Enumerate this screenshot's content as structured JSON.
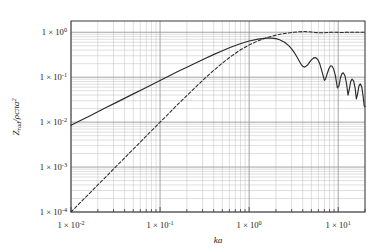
{
  "figure": {
    "background_color": "#ffffff",
    "frame_color": "#3a3a3a",
    "major_grid_color": "#9a9a9a",
    "minor_grid_color": "#c4c4c4",
    "curve_color": "#2b2b2b"
  },
  "axes": {
    "x": {
      "label": "ka",
      "scale": "log",
      "range": [
        0.01,
        20.0
      ],
      "tick_labels": [
        "1 × 10",
        "1 × 10",
        "1 × 10",
        "1 × 10"
      ],
      "tick_mantissa": "1 × 10",
      "tick_exponents": [
        "-2",
        "-1",
        "0",
        "1"
      ],
      "tick_values": [
        0.01,
        0.1,
        1,
        10
      ]
    },
    "y": {
      "label_parts": {
        "symbol": "Z",
        "subscript": "rad",
        "divider": "/",
        "denominator": "ρcπa",
        "denominator_exponent": "2"
      },
      "label_plain": "Zrad/ρcπa2",
      "scale": "log",
      "range": [
        0.0001,
        1.78
      ],
      "tick_mantissa": "1 × 10",
      "tick_exponents": [
        "0",
        "-1",
        "-2",
        "-3",
        "-4"
      ],
      "tick_values": [
        1,
        0.1,
        0.01,
        0.001,
        0.0001
      ]
    }
  },
  "chart_data": {
    "type": "line",
    "title": "",
    "xlabel": "ka",
    "ylabel": "Zrad/ρcπa2",
    "xscale": "log",
    "yscale": "log",
    "xlim": [
      0.01,
      20.0
    ],
    "ylim": [
      0.0001,
      1.78
    ],
    "grid": true,
    "minor_grid": true,
    "legend": null,
    "series": [
      {
        "name": "reactance",
        "style": "solid",
        "points": [
          [
            0.01,
            0.00849
          ],
          [
            0.0126,
            0.01069
          ],
          [
            0.0158,
            0.01342
          ],
          [
            0.02,
            0.01698
          ],
          [
            0.0251,
            0.02131
          ],
          [
            0.0316,
            0.02683
          ],
          [
            0.0398,
            0.03378
          ],
          [
            0.0501,
            0.04252
          ],
          [
            0.0631,
            0.05352
          ],
          [
            0.0794,
            0.06732
          ],
          [
            0.1,
            0.08465
          ],
          [
            0.126,
            0.1063
          ],
          [
            0.158,
            0.1332
          ],
          [
            0.2,
            0.1666
          ],
          [
            0.251,
            0.2077
          ],
          [
            0.316,
            0.2578
          ],
          [
            0.398,
            0.3179
          ],
          [
            0.501,
            0.3886
          ],
          [
            0.631,
            0.4687
          ],
          [
            0.794,
            0.5541
          ],
          [
            1.0,
            0.637
          ],
          [
            1.26,
            0.7052
          ],
          [
            1.58,
            0.7425
          ],
          [
            1.8,
            0.742
          ],
          [
            2.0,
            0.7208
          ],
          [
            2.2,
            0.6818
          ],
          [
            2.5,
            0.5979
          ],
          [
            2.8,
            0.4968
          ],
          [
            3.0,
            0.4266
          ],
          [
            3.2,
            0.3577
          ],
          [
            3.5,
            0.267
          ],
          [
            3.83,
            0.1939
          ],
          [
            4.0,
            0.1745
          ],
          [
            4.2,
            0.1676
          ],
          [
            4.5,
            0.184
          ],
          [
            4.8,
            0.2186
          ],
          [
            5.0,
            0.2425
          ],
          [
            5.33,
            0.27
          ],
          [
            5.6,
            0.272
          ],
          [
            5.9,
            0.248
          ],
          [
            6.2,
            0.201
          ],
          [
            6.5,
            0.145
          ],
          [
            7.0,
            0.0846
          ],
          [
            7.2,
            0.0905
          ],
          [
            7.5,
            0.118
          ],
          [
            7.9,
            0.158
          ],
          [
            8.2,
            0.178
          ],
          [
            8.5,
            0.177
          ],
          [
            8.9,
            0.152
          ],
          [
            9.3,
            0.108
          ],
          [
            9.8,
            0.0575
          ],
          [
            10.2,
            0.064
          ],
          [
            10.6,
            0.096
          ],
          [
            11.0,
            0.119
          ],
          [
            11.4,
            0.125
          ],
          [
            11.9,
            0.108
          ],
          [
            12.4,
            0.073
          ],
          [
            12.9,
            0.0398
          ],
          [
            13.3,
            0.053
          ],
          [
            13.8,
            0.079
          ],
          [
            14.3,
            0.091
          ],
          [
            14.9,
            0.083
          ],
          [
            15.5,
            0.057
          ],
          [
            16.0,
            0.033
          ],
          [
            16.5,
            0.042
          ],
          [
            17.1,
            0.064
          ],
          [
            17.7,
            0.071
          ],
          [
            18.4,
            0.061
          ],
          [
            19.0,
            0.039
          ],
          [
            19.6,
            0.0228
          ],
          [
            20.0,
            0.0222
          ]
        ]
      },
      {
        "name": "resistance",
        "style": "dashed",
        "points": [
          [
            0.01,
            0.0001
          ],
          [
            0.0126,
            0.000159
          ],
          [
            0.0158,
            0.00025
          ],
          [
            0.02,
            0.0004
          ],
          [
            0.0251,
            0.00063
          ],
          [
            0.0316,
            0.001
          ],
          [
            0.0398,
            0.00158
          ],
          [
            0.0501,
            0.00251
          ],
          [
            0.0631,
            0.00398
          ],
          [
            0.0794,
            0.0063
          ],
          [
            0.1,
            0.00997
          ],
          [
            0.126,
            0.01575
          ],
          [
            0.158,
            0.02478
          ],
          [
            0.2,
            0.03882
          ],
          [
            0.251,
            0.06036
          ],
          [
            0.316,
            0.09276
          ],
          [
            0.398,
            0.1402
          ],
          [
            0.501,
            0.2063
          ],
          [
            0.631,
            0.2939
          ],
          [
            0.794,
            0.4016
          ],
          [
            1.0,
            0.5215
          ],
          [
            1.26,
            0.6442
          ],
          [
            1.58,
            0.7607
          ],
          [
            2.0,
            0.8635
          ],
          [
            2.5,
            0.9414
          ],
          [
            3.0,
            0.9851
          ],
          [
            3.5,
            1.017
          ],
          [
            3.83,
            1.031
          ],
          [
            4.2,
            1.035
          ],
          [
            4.6,
            1.027
          ],
          [
            5.0,
            1.013
          ],
          [
            5.5,
            0.9905
          ],
          [
            6.0,
            0.9758
          ],
          [
            6.5,
            0.9709
          ],
          [
            7.0,
            0.9748
          ],
          [
            7.5,
            0.9838
          ],
          [
            8.0,
            0.993
          ],
          [
            8.5,
            0.9986
          ],
          [
            9.0,
            0.9995
          ],
          [
            9.5,
            0.9965
          ],
          [
            10.5,
            0.9895
          ],
          [
            11.5,
            0.9892
          ],
          [
            12.5,
            0.9954
          ],
          [
            13.5,
            1.002
          ],
          [
            14.5,
            1.004
          ],
          [
            15.5,
            1.0
          ],
          [
            16.5,
            0.9959
          ],
          [
            17.5,
            0.9957
          ],
          [
            18.5,
            0.999
          ],
          [
            19.5,
            1.002
          ],
          [
            20.0,
            1.002
          ]
        ]
      }
    ]
  }
}
